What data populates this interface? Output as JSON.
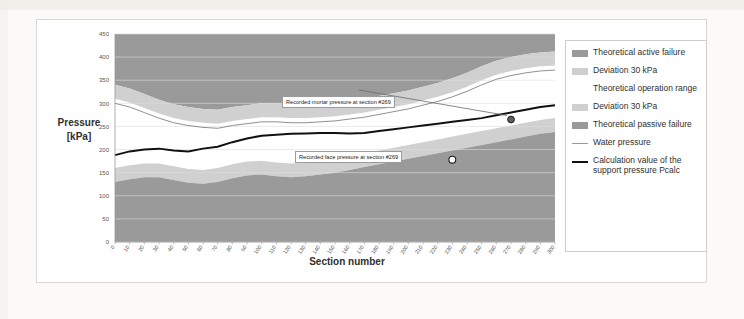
{
  "figure": {
    "ghost_scan_text_top": "",
    "ghost_scan_text_top2": "",
    "ghost_scan_text_left": ""
  },
  "axes": {
    "y_title_line1": "Pressure",
    "y_title_line2": "[kPa]",
    "x_title": "Section number"
  },
  "legend": {
    "items": [
      {
        "label": "Theoretical active failure",
        "swatch": "band-dark",
        "color": "#9a9a9a"
      },
      {
        "label": "Deviation 30 kPa",
        "swatch": "band-light",
        "color": "#d0d0d0"
      },
      {
        "label": "Theoretical operation range",
        "swatch": "none",
        "color": "#ffffff"
      },
      {
        "label": "Deviation 30 kPa",
        "swatch": "band-light",
        "color": "#d0d0d0"
      },
      {
        "label": "Theoretical passive failure",
        "swatch": "band-dark",
        "color": "#9a9a9a"
      },
      {
        "label": "Water pressure",
        "swatch": "thin-line",
        "color": "#9a9a9a"
      },
      {
        "label": "Calculation value of the support pressure Pcalc",
        "swatch": "thick-line",
        "color": "#111111"
      }
    ]
  },
  "annotations": [
    {
      "name": "recorded-mortar-pressure",
      "text": "Recorded mortar pressure  at section #269",
      "point_section": 270,
      "point_value": 265
    },
    {
      "name": "recorded-face-pressure",
      "text": "Recorded face pressure at section #269",
      "point_section": 230,
      "point_value": 178
    }
  ],
  "chart_data": {
    "type": "area",
    "title": "",
    "xlabel": "Section number",
    "ylabel": "Pressure [kPa]",
    "xlim": [
      0,
      300
    ],
    "ylim": [
      0,
      450
    ],
    "ytick_labels": [
      "0",
      "50",
      "100",
      "150",
      "200",
      "250",
      "300",
      "350",
      "400",
      "450"
    ],
    "yticks": [
      0,
      50,
      100,
      150,
      200,
      250,
      300,
      350,
      400,
      450
    ],
    "xtick_labels": [
      "0",
      "10",
      "20",
      "30",
      "40",
      "50",
      "60",
      "70",
      "80",
      "90",
      "100",
      "110",
      "120",
      "130",
      "140",
      "150",
      "160",
      "170",
      "180",
      "190",
      "200",
      "210",
      "220",
      "230",
      "240",
      "250",
      "260",
      "270",
      "280",
      "290",
      "300"
    ],
    "xticks": [
      0,
      10,
      20,
      30,
      40,
      50,
      60,
      70,
      80,
      90,
      100,
      110,
      120,
      130,
      140,
      150,
      160,
      170,
      180,
      190,
      200,
      210,
      220,
      230,
      240,
      250,
      260,
      270,
      280,
      290,
      300
    ],
    "grid": true,
    "legend_position": "right",
    "x": [
      0,
      10,
      20,
      30,
      40,
      50,
      60,
      70,
      80,
      90,
      100,
      110,
      120,
      130,
      140,
      150,
      160,
      170,
      180,
      190,
      200,
      210,
      220,
      230,
      240,
      250,
      260,
      270,
      280,
      290,
      300
    ],
    "series": [
      {
        "name": "Theoretical active failure upper boundary",
        "role": "upper-dark-band-top",
        "values": [
          450,
          450,
          450,
          450,
          450,
          450,
          450,
          450,
          450,
          450,
          450,
          450,
          450,
          450,
          450,
          450,
          450,
          450,
          450,
          450,
          450,
          450,
          450,
          450,
          450,
          450,
          450,
          450,
          450,
          450,
          450
        ]
      },
      {
        "name": "Theoretical active failure lower boundary",
        "role": "upper-dark-band-bottom",
        "values": [
          340,
          332,
          320,
          308,
          298,
          292,
          288,
          286,
          292,
          296,
          300,
          300,
          298,
          298,
          300,
          302,
          306,
          310,
          316,
          322,
          328,
          336,
          344,
          354,
          366,
          380,
          392,
          400,
          406,
          410,
          412
        ]
      },
      {
        "name": "Deviation 30 kPa (upper) lower boundary",
        "role": "upper-light-band-bottom",
        "values": [
          310,
          302,
          290,
          278,
          268,
          262,
          258,
          256,
          262,
          266,
          270,
          270,
          268,
          268,
          270,
          272,
          276,
          280,
          286,
          292,
          298,
          306,
          314,
          324,
          336,
          350,
          362,
          370,
          376,
          380,
          382
        ]
      },
      {
        "name": "Water pressure",
        "role": "thin-line",
        "values": [
          300,
          292,
          280,
          268,
          258,
          252,
          248,
          246,
          252,
          256,
          260,
          260,
          258,
          258,
          260,
          262,
          266,
          270,
          276,
          282,
          288,
          296,
          304,
          314,
          326,
          340,
          352,
          360,
          366,
          370,
          372
        ]
      },
      {
        "name": "Calculation value of the support pressure Pcalc",
        "role": "thick-line",
        "values": [
          188,
          196,
          200,
          202,
          198,
          196,
          202,
          206,
          216,
          224,
          230,
          232,
          234,
          235,
          236,
          236,
          235,
          236,
          240,
          244,
          248,
          252,
          256,
          260,
          264,
          268,
          274,
          280,
          286,
          292,
          296
        ]
      },
      {
        "name": "Theoretical operation range lower boundary",
        "role": "lower-light-band-top",
        "values": [
          160,
          166,
          170,
          170,
          164,
          158,
          156,
          160,
          168,
          174,
          176,
          172,
          170,
          172,
          176,
          180,
          186,
          192,
          198,
          204,
          210,
          216,
          222,
          228,
          234,
          240,
          246,
          252,
          258,
          264,
          268
        ]
      },
      {
        "name": "Theoretical passive failure upper boundary",
        "role": "lower-dark-band-top",
        "values": [
          130,
          136,
          140,
          140,
          134,
          128,
          126,
          130,
          138,
          144,
          146,
          142,
          140,
          142,
          146,
          150,
          156,
          162,
          168,
          174,
          180,
          186,
          192,
          198,
          204,
          210,
          216,
          222,
          228,
          234,
          238
        ]
      },
      {
        "name": "Theoretical passive failure lower boundary",
        "role": "lower-dark-band-bottom",
        "values": [
          0,
          0,
          0,
          0,
          0,
          0,
          0,
          0,
          0,
          0,
          0,
          0,
          0,
          0,
          0,
          0,
          0,
          0,
          0,
          0,
          0,
          0,
          0,
          0,
          0,
          0,
          0,
          0,
          0,
          0,
          0
        ]
      }
    ],
    "markers": [
      {
        "name": "mortar-pressure-marker",
        "x": 270,
        "y": 265,
        "style": "filled-circle"
      },
      {
        "name": "face-pressure-marker",
        "x": 230,
        "y": 178,
        "style": "open-circle"
      }
    ],
    "colors": {
      "band_dark": "#9a9a9a",
      "band_light": "#d0d0d0",
      "operation_range": "#ffffff",
      "water_line": "#8f8f8f",
      "calc_line": "#111111",
      "plot_bg": "#ffffff",
      "grid": "#dedede"
    }
  }
}
